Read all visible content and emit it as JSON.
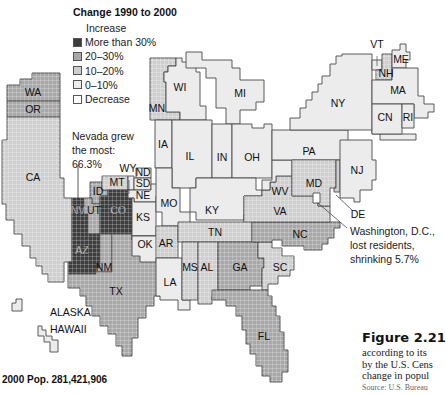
{
  "legend": {
    "title": "Change 1990 to 2000",
    "header": "Increase",
    "items": [
      {
        "label": "More than 30%",
        "color": "#3d3d3d"
      },
      {
        "label": "20–30%",
        "color": "#a8a8a8"
      },
      {
        "label": "10–20%",
        "color": "#cfcfcf"
      },
      {
        "label": "0–10%",
        "color": "#ececec"
      },
      {
        "label": "Decrease",
        "color": "#ffffff"
      }
    ]
  },
  "annotations": {
    "nevada": "Nevada grew the most: 66.3%",
    "nevada_lines": [
      "Nevada grew",
      "the most:",
      "66.3%"
    ],
    "dc_lines": [
      "Washington, D.C.,",
      "lost residents,",
      "shrinking 5.7%"
    ]
  },
  "states": [
    {
      "abbr": "WA",
      "category": "20–30%"
    },
    {
      "abbr": "OR",
      "category": "20–30%"
    },
    {
      "abbr": "CA",
      "category": "10–20%"
    },
    {
      "abbr": "NV",
      "category": "More than 30%"
    },
    {
      "abbr": "UT",
      "category": "20–30%"
    },
    {
      "abbr": "CO",
      "category": "More than 30%"
    },
    {
      "abbr": "AZ",
      "category": "More than 30%"
    },
    {
      "abbr": "NM",
      "category": "20–30%"
    },
    {
      "abbr": "ID",
      "category": "20–30%"
    },
    {
      "abbr": "MT",
      "category": "10–20%"
    },
    {
      "abbr": "WY",
      "category": "0–10%"
    },
    {
      "abbr": "ND",
      "category": "0–10%"
    },
    {
      "abbr": "SD",
      "category": "0–10%"
    },
    {
      "abbr": "NE",
      "category": "0–10%"
    },
    {
      "abbr": "KS",
      "category": "0–10%"
    },
    {
      "abbr": "OK",
      "category": "0–10%"
    },
    {
      "abbr": "TX",
      "category": "20–30%"
    },
    {
      "abbr": "MN",
      "category": "10–20%"
    },
    {
      "abbr": "WI",
      "category": "0–10%"
    },
    {
      "abbr": "MI",
      "category": "0–10%"
    },
    {
      "abbr": "IA",
      "category": "0–10%"
    },
    {
      "abbr": "IL",
      "category": "0–10%"
    },
    {
      "abbr": "IN",
      "category": "0–10%"
    },
    {
      "abbr": "OH",
      "category": "0–10%"
    },
    {
      "abbr": "MO",
      "category": "0–10%"
    },
    {
      "abbr": "KY",
      "category": "0–10%"
    },
    {
      "abbr": "AR",
      "category": "10–20%"
    },
    {
      "abbr": "LA",
      "category": "0–10%"
    },
    {
      "abbr": "TN",
      "category": "10–20%"
    },
    {
      "abbr": "MS",
      "category": "10–20%"
    },
    {
      "abbr": "AL",
      "category": "10–20%"
    },
    {
      "abbr": "GA",
      "category": "20–30%"
    },
    {
      "abbr": "SC",
      "category": "10–20%"
    },
    {
      "abbr": "NC",
      "category": "20–30%"
    },
    {
      "abbr": "VA",
      "category": "10–20%"
    },
    {
      "abbr": "WV",
      "category": "0–10%"
    },
    {
      "abbr": "MD",
      "category": "10–20%"
    },
    {
      "abbr": "DE",
      "category": "10–20%"
    },
    {
      "abbr": "PA",
      "category": "0–10%"
    },
    {
      "abbr": "NJ",
      "category": "0–10%"
    },
    {
      "abbr": "NY",
      "category": "0–10%"
    },
    {
      "abbr": "VT",
      "category": "0–10%"
    },
    {
      "abbr": "NH",
      "category": "10–20%"
    },
    {
      "abbr": "ME",
      "category": "0–10%"
    },
    {
      "abbr": "MA",
      "category": "0–10%"
    },
    {
      "abbr": "CN",
      "category": "0–10%"
    },
    {
      "abbr": "RI",
      "category": "0–10%"
    },
    {
      "abbr": "FL",
      "category": "20–30%"
    },
    {
      "abbr": "DC",
      "category": "Decrease"
    }
  ],
  "insets": {
    "alaska": "ALASKA",
    "hawaii": "HAWAII"
  },
  "total_population": "2000 Pop. 281,421,906",
  "figure": {
    "number": "Figure 2.21",
    "caption_lines": [
      "according to its",
      "by the U.S. Cens",
      "change in popul"
    ],
    "source": "Source: U.S. Bureau"
  }
}
